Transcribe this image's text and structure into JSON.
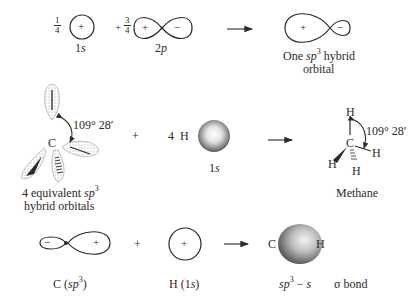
{
  "row1": {
    "coef_s": {
      "num": "1",
      "den": "4"
    },
    "s_orbital": {
      "sign": "+",
      "label_num": "1",
      "label_it": "s"
    },
    "coef_p_sign": "+",
    "coef_p": {
      "num": "3",
      "den": "4"
    },
    "p_orbital": {
      "pos_sign": "+",
      "neg_sign": "−",
      "label_num": "2",
      "label_it": "p"
    },
    "hybrid": {
      "pos_sign": "+",
      "neg_sign": "−",
      "label_line1_pre": "One ",
      "label_line1_it": "sp",
      "label_line1_sup": "3",
      "label_line1_post": " hybrid",
      "label_line2": "orbital"
    }
  },
  "row2": {
    "carbon_label": "C",
    "angle_label": "109° 28′",
    "orbitals_label_pre": "4 equivalent ",
    "orbitals_label_it": "sp",
    "orbitals_label_sup": "3",
    "orbitals_label_line2": "hybrid orbitals",
    "plus": "+",
    "hydrogen_count": "4  H",
    "h_orbital_label_num": "1",
    "h_orbital_label_it": "s",
    "methane": {
      "carbon": "C",
      "hydrogens": [
        "H",
        "H",
        "H",
        "H"
      ],
      "angle_label": "109° 28′",
      "name": "Methane"
    }
  },
  "row3": {
    "c_sp3": {
      "neg_sign": "−",
      "pos_sign": "+",
      "label_pre": "C (",
      "label_it": "sp",
      "label_sup": "3",
      "label_post": ")"
    },
    "plus": "+",
    "h_1s": {
      "sign": "+",
      "label_pre": "H (1",
      "label_it": "s",
      "label_post": ")"
    },
    "bond": {
      "left_atom": "C",
      "right_atom": "H",
      "label_it": "sp",
      "label_sup": "3",
      "label_mid": " − ",
      "label_it2": "s",
      "label_post": "σ bond"
    }
  },
  "colors": {
    "ink": "#2a2a2a",
    "stipple": "#8a8a8a"
  }
}
